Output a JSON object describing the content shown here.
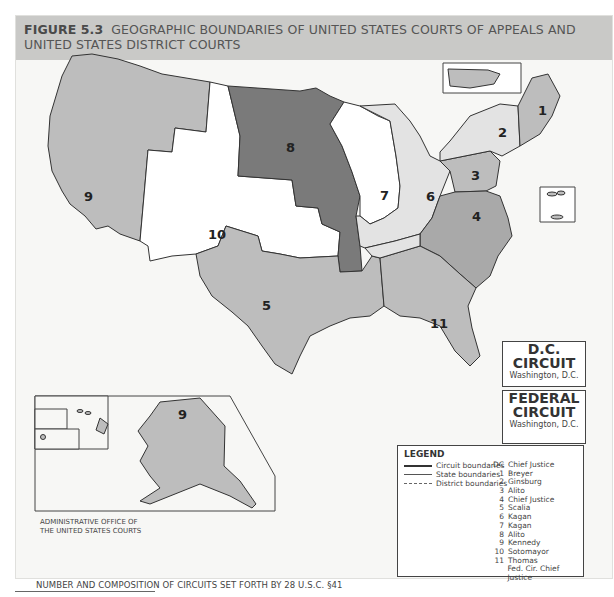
{
  "header": {
    "figure_label": "FIGURE 5.3",
    "title": "GEOGRAPHIC BOUNDARIES OF UNITED STATES COURTS OF APPEALS AND UNITED STATES DISTRICT COURTS"
  },
  "colors": {
    "header_bg": "#c9c9c7",
    "circuit_light": "#bdbdbd",
    "circuit_mid": "#a9a9a9",
    "circuit_dark": "#7a7a7a",
    "circuit_white": "#ffffff",
    "circuit_pale": "#e3e3e3"
  },
  "circuits": [
    {
      "number": "1",
      "states": [
        "Maine",
        "New Hampshire",
        "Massachusetts",
        "Rhode Island",
        "Puerto Rico"
      ]
    },
    {
      "number": "2",
      "states": [
        "New York Northern",
        "New York Western",
        "New York Southern",
        "New York Eastern",
        "Vermont",
        "Conn."
      ]
    },
    {
      "number": "3",
      "states": [
        "Pennsylvania Western",
        "Pennsylvania Middle",
        "Pennsylvania Eastern",
        "New Jersey",
        "Delaware",
        "Virgin Islands"
      ]
    },
    {
      "number": "4",
      "states": [
        "Maryland",
        "Virginia Western",
        "Virginia Eastern",
        "West Virginia Northern",
        "West Virginia Southern",
        "North Carolina Western",
        "North Carolina Middle",
        "North Carolina Eastern",
        "South Carolina"
      ]
    },
    {
      "number": "5",
      "states": [
        "Texas Northern",
        "Texas Eastern",
        "Texas Western",
        "Texas Southern",
        "Louisiana Western",
        "Louisiana Middle",
        "Louisiana Eastern",
        "Mississippi Northern",
        "Mississippi Southern"
      ]
    },
    {
      "number": "6",
      "states": [
        "Michigan Western",
        "Michigan Eastern",
        "Ohio Northern",
        "Ohio Southern",
        "Kentucky Western",
        "Kentucky Eastern",
        "Tennessee Western",
        "Tennessee Middle",
        "Tennessee Eastern"
      ]
    },
    {
      "number": "7",
      "states": [
        "Wisconsin Western",
        "Wisconsin Eastern",
        "Illinois Northern",
        "Illinois Central",
        "Illinois Southern",
        "Indiana Northern",
        "Indiana Southern"
      ]
    },
    {
      "number": "8",
      "states": [
        "North Dakota",
        "South Dakota",
        "Nebraska",
        "Minnesota",
        "Iowa Northern",
        "Iowa Southern",
        "Missouri Western",
        "Missouri Eastern",
        "Arkansas Western",
        "Arkansas Eastern"
      ]
    },
    {
      "number": "9",
      "states": [
        "Washington Western",
        "Washington Eastern",
        "Oregon",
        "Idaho",
        "Montana",
        "Nevada",
        "California Northern",
        "California Eastern",
        "California Central",
        "California Southern",
        "Arizona",
        "Alaska",
        "Hawaii",
        "Guam",
        "Northern Mariana Island"
      ]
    },
    {
      "number": "10",
      "states": [
        "Wyoming",
        "Utah",
        "Colorado",
        "Kansas",
        "New Mexico",
        "Oklahoma Northern",
        "Oklahoma Western",
        "Oklahoma Eastern"
      ]
    },
    {
      "number": "11",
      "states": [
        "Alabama Northern",
        "Alabama Middle",
        "Alabama Southern",
        "Georgia Northern",
        "Georgia Middle",
        "Georgia Southern",
        "Florida Northern",
        "Florida Middle",
        "Florida Southern"
      ]
    }
  ],
  "map_labels": {
    "puerto_rico": "Puerto Rico",
    "virgin_islands": "Virgin Islands",
    "district_of_columbia": "District of Columbia",
    "alaska": "Alaska",
    "hawaii": "Hawaii",
    "guam": "Guam",
    "northern_mariana": "Northern Mariana Island",
    "alaska_circuit": "9"
  },
  "dc_circuit": {
    "title_line1": "D.C.",
    "title_line2": "CIRCUIT",
    "location": "Washington, D.C."
  },
  "federal_circuit": {
    "title_line1": "FEDERAL",
    "title_line2": "CIRCUIT",
    "location": "Washington, D.C."
  },
  "legend": {
    "title": "LEGEND",
    "line_types": [
      {
        "style": "circuit",
        "label": "Circuit boundaries"
      },
      {
        "style": "state",
        "label": "State boundaries"
      },
      {
        "style": "district",
        "label": "District boundaries"
      }
    ],
    "justices": [
      {
        "circuit": "DC",
        "justice": "Chief Justice"
      },
      {
        "circuit": "1",
        "justice": "Breyer"
      },
      {
        "circuit": "2",
        "justice": "Ginsburg"
      },
      {
        "circuit": "3",
        "justice": "Alito"
      },
      {
        "circuit": "4",
        "justice": "Chief Justice"
      },
      {
        "circuit": "5",
        "justice": "Scalia"
      },
      {
        "circuit": "6",
        "justice": "Kagan"
      },
      {
        "circuit": "7",
        "justice": "Kagan"
      },
      {
        "circuit": "8",
        "justice": "Alito"
      },
      {
        "circuit": "9",
        "justice": "Kennedy"
      },
      {
        "circuit": "10",
        "justice": "Sotomayor"
      },
      {
        "circuit": "11",
        "justice": "Thomas"
      },
      {
        "circuit": "",
        "justice": "Fed. Cir. Chief Justice"
      }
    ]
  },
  "admin_office": {
    "line1": "ADMINISTRATIVE OFFICE OF",
    "line2": "THE UNITED STATES COURTS"
  },
  "caption": "NUMBER AND COMPOSITION OF CIRCUITS SET FORTH BY 28 U.S.C. §41"
}
